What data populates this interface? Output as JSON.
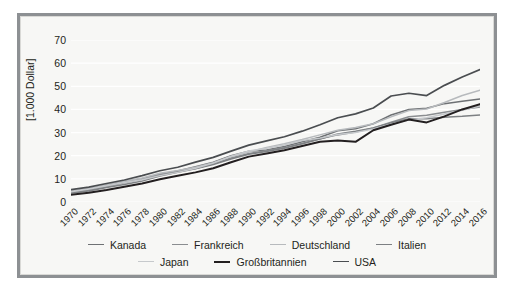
{
  "frame": {
    "border_color": "#8d9093",
    "background": "#f7f7f5"
  },
  "chart_data": {
    "type": "line",
    "title": "",
    "xlabel": "",
    "ylabel": "[1.000 Dollar]",
    "ylim": [
      0,
      70
    ],
    "yticks": [
      0,
      10,
      20,
      30,
      40,
      50,
      60,
      70
    ],
    "grid": true,
    "legend_position": "bottom",
    "x": [
      1970,
      1972,
      1974,
      1976,
      1978,
      1980,
      1982,
      1984,
      1986,
      1988,
      1990,
      1992,
      1994,
      1996,
      1998,
      2000,
      2002,
      2004,
      2006,
      2008,
      2010,
      2012,
      2014,
      2016
    ],
    "categories": [
      "1970",
      "1972",
      "1974",
      "1976",
      "1978",
      "1980",
      "1982",
      "1984",
      "1986",
      "1988",
      "1990",
      "1992",
      "1994",
      "1996",
      "1998",
      "2000",
      "2002",
      "2004",
      "2006",
      "2008",
      "2010",
      "2012",
      "2014",
      "2016"
    ],
    "series": [
      {
        "name": "Kanada",
        "color": "#6e7174",
        "width": 1.5,
        "values": [
          4.3,
          5.3,
          7.2,
          8.9,
          10.0,
          11.9,
          13.4,
          15.2,
          17.2,
          20.0,
          21.9,
          22.5,
          24.0,
          26.0,
          28.0,
          30.8,
          31.6,
          33.8,
          37.6,
          40.0,
          40.5,
          42.5,
          43.5,
          44.5
        ]
      },
      {
        "name": "Frankreich",
        "color": "#8a8d90",
        "width": 1.5,
        "values": [
          4.0,
          5.0,
          6.6,
          8.3,
          9.8,
          12.0,
          13.2,
          14.5,
          16.5,
          19.0,
          21.0,
          22.2,
          23.5,
          25.3,
          27.3,
          29.0,
          30.2,
          32.0,
          34.5,
          36.8,
          37.5,
          38.8,
          40.0,
          41.0
        ]
      },
      {
        "name": "Deutschland",
        "color": "#b7babd",
        "width": 1.5,
        "values": [
          4.8,
          5.8,
          7.4,
          9.0,
          10.4,
          12.4,
          13.6,
          15.0,
          17.0,
          19.6,
          21.6,
          23.6,
          25.2,
          27.0,
          29.0,
          31.0,
          32.2,
          33.8,
          36.8,
          39.5,
          40.2,
          43.0,
          46.0,
          48.3
        ]
      },
      {
        "name": "Italien",
        "color": "#7d8083",
        "width": 1.5,
        "values": [
          3.9,
          4.8,
          6.3,
          7.6,
          9.1,
          11.2,
          12.8,
          14.4,
          16.2,
          18.6,
          20.6,
          21.8,
          23.2,
          25.2,
          27.2,
          29.4,
          30.6,
          32.0,
          34.2,
          36.0,
          36.0,
          36.6,
          37.0,
          37.6
        ]
      },
      {
        "name": "Japan",
        "color": "#c6c9cc",
        "width": 1.5,
        "values": [
          4.4,
          5.6,
          7.0,
          8.4,
          9.6,
          11.4,
          12.8,
          14.6,
          16.8,
          19.8,
          22.0,
          23.2,
          24.6,
          26.6,
          27.6,
          29.2,
          30.0,
          31.6,
          33.6,
          35.4,
          36.4,
          38.0,
          39.6,
          41.5
        ]
      },
      {
        "name": "Großbritannien",
        "color": "#231f20",
        "width": 2.0,
        "values": [
          3.1,
          4.0,
          5.2,
          6.6,
          8.0,
          9.8,
          11.3,
          12.8,
          14.6,
          17.2,
          19.6,
          21.0,
          22.4,
          24.2,
          26.0,
          26.6,
          26.0,
          31.0,
          33.4,
          35.6,
          34.4,
          37.0,
          40.0,
          42.3
        ]
      },
      {
        "name": "USA",
        "color": "#4a4d50",
        "width": 1.7,
        "values": [
          5.3,
          6.4,
          8.0,
          9.5,
          11.4,
          13.5,
          15.0,
          17.2,
          19.3,
          22.0,
          24.6,
          26.4,
          28.2,
          30.6,
          33.4,
          36.4,
          38.1,
          40.6,
          45.8,
          47.0,
          46.0,
          50.4,
          54.0,
          57.2
        ]
      }
    ]
  }
}
